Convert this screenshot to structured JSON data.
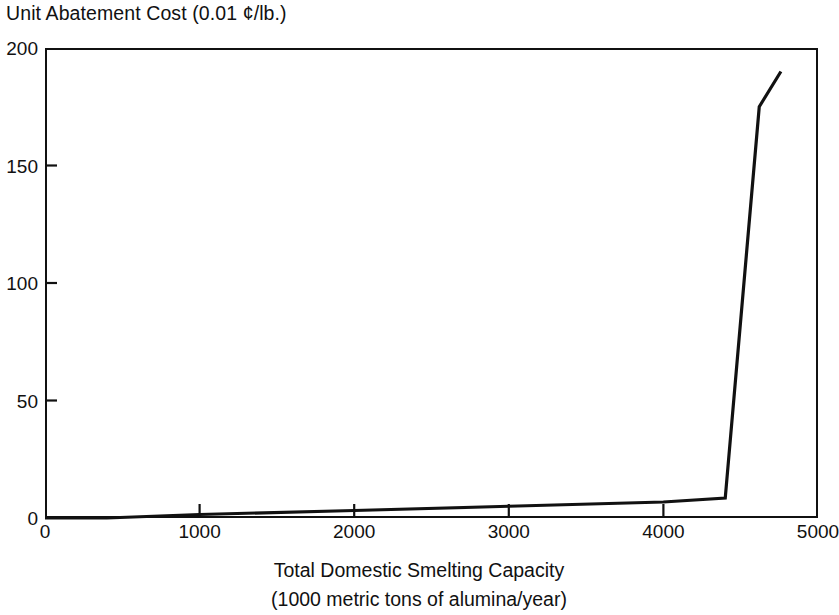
{
  "figure": {
    "y_axis_title": "Unit Abatement Cost (0.01 ¢/lb.)",
    "x_axis_title_line1": "Total Domestic Smelting Capacity",
    "x_axis_title_line2": "(1000 metric tons of alumina/year)",
    "line_color": "#111111",
    "frame_color": "#111111",
    "background_color": "#ffffff"
  },
  "chart_data": {
    "type": "line",
    "title": "",
    "xlabel": "Total Domestic Smelting Capacity (1000 metric tons of alumina/year)",
    "ylabel": "Unit Abatement Cost (0.01 ¢/lb.)",
    "xlim": [
      0,
      5000
    ],
    "ylim": [
      0,
      200
    ],
    "xticks": [
      0,
      1000,
      2000,
      3000,
      4000,
      5000
    ],
    "yticks": [
      0,
      50,
      100,
      150,
      200
    ],
    "xtick_labels": [
      "0",
      "1000",
      "2000",
      "3000",
      "4000",
      "5000"
    ],
    "ytick_labels": [
      "0",
      "50",
      "100",
      "150",
      "200"
    ],
    "grid": false,
    "legend": "none",
    "tick_direction": "in",
    "series": [
      {
        "name": "Marginal abatement cost curve",
        "x": [
          0,
          400,
          1000,
          2000,
          3000,
          4000,
          4400,
          4620,
          4760
        ],
        "y": [
          0,
          0,
          1.5,
          3.2,
          5.0,
          6.8,
          8.5,
          175,
          190
        ]
      }
    ]
  }
}
